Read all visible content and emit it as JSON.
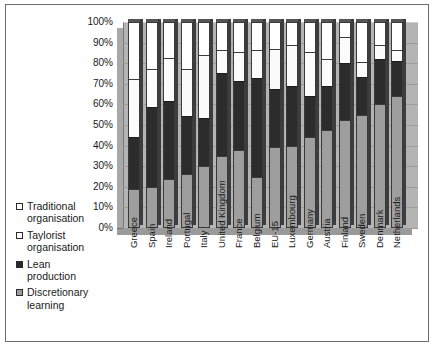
{
  "chart_data": {
    "type": "bar",
    "subtype": "100% stacked column",
    "title": "",
    "xlabel": "",
    "ylabel": "",
    "ylim": [
      0,
      100
    ],
    "grid": true,
    "legend_position": "left",
    "tick_labels": [
      "100%",
      "90%",
      "80%",
      "70%",
      "60%",
      "50%",
      "40%",
      "30%",
      "20%",
      "10%",
      "0%"
    ],
    "categories": [
      "Greece",
      "Spain",
      "Ireland",
      "Portugal",
      "Italy",
      "United Kingdom",
      "France",
      "Belgium",
      "EU-15",
      "Luxembourg",
      "Germany",
      "Austria",
      "Finland",
      "Sweden",
      "Denmark",
      "Netherlands"
    ],
    "series": [
      {
        "name": "Discretionary learning",
        "color": "#9e9e9e",
        "values": [
          18.7,
          20.0,
          24.0,
          26.1,
          30.0,
          34.8,
          38.0,
          25.0,
          39.1,
          39.8,
          44.3,
          47.5,
          52.6,
          55.0,
          60.0,
          64.0
        ]
      },
      {
        "name": "Lean production",
        "color": "#2c2c2c",
        "values": [
          25.6,
          38.8,
          37.8,
          28.1,
          23.6,
          40.6,
          33.3,
          47.7,
          28.2,
          29.2,
          19.6,
          21.5,
          27.4,
          18.5,
          21.9,
          17.0
        ]
      },
      {
        "name": "Taylorist organisation",
        "color": "#fbfbfb",
        "values": [
          28.0,
          18.5,
          20.7,
          23.0,
          30.4,
          10.9,
          14.1,
          13.9,
          19.5,
          20.0,
          21.5,
          13.1,
          12.5,
          7.1,
          6.8,
          5.3
        ]
      },
      {
        "name": "Traditional organisation",
        "color": "#ffffff",
        "values": [
          27.7,
          22.7,
          17.5,
          22.8,
          16.0,
          13.7,
          14.6,
          13.4,
          13.2,
          11.0,
          14.6,
          17.9,
          7.5,
          19.4,
          11.3,
          13.7
        ]
      }
    ]
  },
  "legend": {
    "items": [
      {
        "label": "Traditional\norganisation",
        "swatch": "sw-white"
      },
      {
        "label": "Taylorist\norganisation",
        "swatch": "sw-tayl"
      },
      {
        "label": "Lean\nproduction",
        "swatch": "sw-lean"
      },
      {
        "label": "Discretionary\nlearning",
        "swatch": "sw-disc"
      }
    ]
  }
}
